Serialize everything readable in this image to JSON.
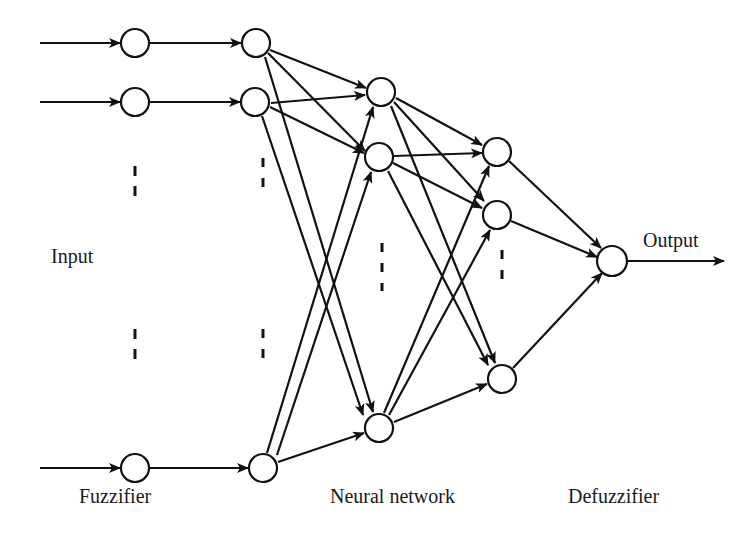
{
  "diagram": {
    "type": "fuzzy-neural-network",
    "labels": {
      "input": "Input",
      "fuzzifier": "Fuzzifier",
      "neural_network": "Neural network",
      "defuzzifier": "Defuzzifier",
      "output": "Output"
    },
    "layers": [
      {
        "name": "fuzzifier-in",
        "nodes": [
          [
            135,
            43
          ],
          [
            135,
            102
          ],
          [
            135,
            468
          ]
        ]
      },
      {
        "name": "fuzzifier-out",
        "nodes": [
          [
            256,
            43
          ],
          [
            255,
            102
          ],
          [
            263,
            468
          ]
        ]
      },
      {
        "name": "hidden-1",
        "nodes": [
          [
            381,
            92
          ],
          [
            379,
            157
          ],
          [
            379,
            428
          ]
        ]
      },
      {
        "name": "hidden-2",
        "nodes": [
          [
            497,
            152
          ],
          [
            497,
            215
          ],
          [
            502,
            379
          ]
        ]
      },
      {
        "name": "defuzzifier",
        "nodes": [
          [
            612,
            261
          ]
        ]
      }
    ],
    "colors": {
      "stroke": "#111111",
      "fill": "#ffffff",
      "text": "#1a1a1a"
    }
  }
}
